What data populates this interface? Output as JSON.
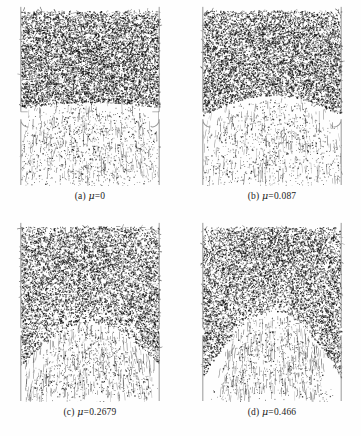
{
  "figure": {
    "width": 361,
    "height": 436,
    "background": "#fefefe",
    "ink_color": "#141414",
    "wall_color": "#8d8d8d",
    "columns": 2,
    "rows": 2
  },
  "chart_data": {
    "type": "scatter",
    "xlabel": "",
    "ylabel": "",
    "grid": false,
    "legend": null,
    "panel_axis_ranges": {
      "x": [
        0,
        1
      ],
      "y": [
        0,
        1
      ]
    },
    "series": [
      {
        "name": "(a) mu=0",
        "friction_coefficient": 0,
        "n_points": 9000,
        "dense_bed_bottom_fraction": 0.565,
        "arch_depth_fraction": 0.03,
        "corner_column_strength": 0.1,
        "plume_spread": 1.0,
        "top_density": 1.0,
        "bottom_density": 0.2,
        "notes": "Frictionless: flat dense bed base, broad dilute plume below"
      },
      {
        "name": "(b) mu=0.087",
        "friction_coefficient": 0.087,
        "n_points": 8400,
        "dense_bed_bottom_fraction": 0.595,
        "arch_depth_fraction": 0.1,
        "corner_column_strength": 0.55,
        "plume_spread": 0.88,
        "top_density": 0.92,
        "bottom_density": 0.18,
        "notes": "Slight funnel taper, dark corner columns begin to appear"
      },
      {
        "name": "(c) mu=0.2679",
        "friction_coefficient": 0.2679,
        "n_points": 9200,
        "dense_bed_bottom_fraction": 0.76,
        "arch_depth_fraction": 0.2,
        "corner_column_strength": 0.8,
        "plume_spread": 0.62,
        "top_density": 0.95,
        "bottom_density": 0.1,
        "notes": "Dense bed reaches low, broad rounded void arch over the orifice"
      },
      {
        "name": "(d) mu=0.466",
        "friction_coefficient": 0.466,
        "n_points": 9400,
        "dense_bed_bottom_fraction": 0.8,
        "arch_depth_fraction": 0.3,
        "corner_column_strength": 1.0,
        "plume_spread": 0.5,
        "top_density": 0.97,
        "bottom_density": 0.07,
        "notes": "Strong corner columns and a deep stagnant arch; narrow central stream"
      }
    ]
  },
  "panels": [
    {
      "id": "panel-a",
      "label": "(a)",
      "mu_symbol": "μ",
      "mu_value": "=0",
      "caption": "(a) μ=0",
      "left": 14,
      "top": 6,
      "width": 152,
      "height": 180,
      "caption_top": 190,
      "seed": 10427
    },
    {
      "id": "panel-b",
      "label": "(b)",
      "mu_symbol": "μ",
      "mu_value": "=0.087",
      "caption": "(b) μ=0.087",
      "left": 196,
      "top": 6,
      "width": 152,
      "height": 180,
      "caption_top": 190,
      "seed": 22853
    },
    {
      "id": "panel-c",
      "label": "(c)",
      "mu_symbol": "μ",
      "mu_value": "=0.2679",
      "caption": "(c) μ=0.2679",
      "left": 14,
      "top": 222,
      "width": 152,
      "height": 180,
      "caption_top": 406,
      "seed": 39181
    },
    {
      "id": "panel-d",
      "label": "(d)",
      "mu_symbol": "μ",
      "mu_value": "=0.466",
      "caption": "(d) μ=0.466",
      "left": 196,
      "top": 222,
      "width": 152,
      "height": 180,
      "caption_top": 406,
      "seed": 47609
    }
  ],
  "geometry": {
    "wall_inset_fraction": 0.045,
    "wall_line_width": 0.9,
    "orifice_half_width_fraction": 0.38,
    "orifice_level_fraction": 0.63,
    "lip_radius_fraction": 0.05,
    "bed_top_fraction": 0.025
  }
}
